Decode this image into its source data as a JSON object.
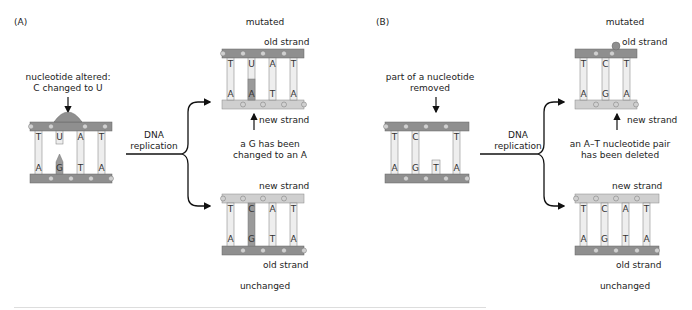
{
  "panels": [
    {
      "id": "A",
      "label": "(A)",
      "annotation": [
        "nucleotide altered:",
        "C changed to U"
      ],
      "process_label": [
        "DNA",
        "replication"
      ],
      "original": {
        "top": [
          "T",
          "U",
          "A",
          "T"
        ],
        "bottom": [
          "A",
          "G",
          "T",
          "A"
        ]
      },
      "mutated": {
        "title": "mutated",
        "top_strand_label": "old strand",
        "bottom_strand_label": "new strand",
        "top": [
          "T",
          "U",
          "A",
          "T"
        ],
        "bottom": [
          "A",
          "A",
          "T",
          "A"
        ],
        "note": [
          "a G has been",
          "changed to an A"
        ]
      },
      "unchanged": {
        "title": "unchanged",
        "top_strand_label": "new strand",
        "bottom_strand_label": "old strand",
        "top": [
          "T",
          "C",
          "A",
          "T"
        ],
        "bottom": [
          "A",
          "G",
          "T",
          "A"
        ]
      }
    },
    {
      "id": "B",
      "label": "(B)",
      "annotation": [
        "part of a nucleotide",
        "removed"
      ],
      "process_label": [
        "DNA",
        "replication"
      ],
      "original": {
        "top": [
          "T",
          "C",
          "",
          "T"
        ],
        "bottom": [
          "A",
          "G",
          "T",
          "A"
        ]
      },
      "mutated": {
        "title": "mutated",
        "top_strand_label": "old strand",
        "bottom_strand_label": "new strand",
        "top": [
          "T",
          "C",
          "T"
        ],
        "bottom": [
          "A",
          "G",
          "A"
        ],
        "note": [
          "an A–T nucleotide pair",
          "has been deleted"
        ]
      },
      "unchanged": {
        "title": "unchanged",
        "top_strand_label": "new strand",
        "bottom_strand_label": "old strand",
        "top": [
          "T",
          "C",
          "A",
          "T"
        ],
        "bottom": [
          "A",
          "G",
          "T",
          "A"
        ]
      }
    }
  ],
  "colors": {
    "old_strand": "#8f8f8f",
    "new_strand": "#cfcfcf",
    "base_fill": "#eeeeee",
    "highlight_base": "#9a9a9a",
    "phosphate": "#c8c8c8",
    "arrow": "#111111"
  }
}
